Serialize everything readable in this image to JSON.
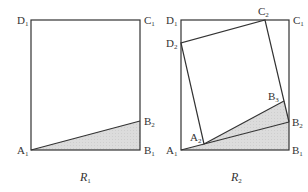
{
  "colors": {
    "stroke": "#333333",
    "shade": "#dcdcdc",
    "background": "#ffffff"
  },
  "figures": [
    {
      "caption": {
        "main": "R",
        "sub": "1"
      },
      "points": {
        "A1": [
          31,
          150
        ],
        "B1": [
          140,
          150
        ],
        "C1": [
          140,
          20
        ],
        "D1": [
          31,
          20
        ],
        "B2": [
          140,
          121
        ]
      },
      "labels": [
        {
          "main": "D",
          "sub": "1",
          "x": 17,
          "y": 24
        },
        {
          "main": "C",
          "sub": "1",
          "x": 144,
          "y": 24
        },
        {
          "main": "B",
          "sub": "2",
          "x": 144,
          "y": 125
        },
        {
          "main": "A",
          "sub": "1",
          "x": 17,
          "y": 154
        },
        {
          "main": "B",
          "sub": "1",
          "x": 144,
          "y": 154
        }
      ]
    },
    {
      "caption": {
        "main": "R",
        "sub": "2"
      },
      "points": {
        "A1": [
          181,
          150
        ],
        "B1": [
          289,
          150
        ],
        "C1": [
          289,
          20
        ],
        "D1": [
          181,
          20
        ],
        "B2": [
          289,
          122
        ],
        "A2": [
          204,
          144
        ],
        "B3": [
          284,
          101
        ],
        "C2": [
          265,
          20
        ],
        "D2": [
          181,
          43
        ]
      },
      "labels": [
        {
          "main": "D",
          "sub": "1",
          "x": 166,
          "y": 24
        },
        {
          "main": "C",
          "sub": "2",
          "x": 258,
          "y": 15
        },
        {
          "main": "C",
          "sub": "1",
          "x": 293,
          "y": 24
        },
        {
          "main": "D",
          "sub": "2",
          "x": 166,
          "y": 47
        },
        {
          "main": "B",
          "sub": "3",
          "x": 268,
          "y": 100
        },
        {
          "main": "B",
          "sub": "2",
          "x": 292,
          "y": 126
        },
        {
          "main": "A",
          "sub": "2",
          "x": 190,
          "y": 141
        },
        {
          "main": "A",
          "sub": "1",
          "x": 166,
          "y": 154
        },
        {
          "main": "B",
          "sub": "1",
          "x": 292,
          "y": 154
        }
      ]
    }
  ]
}
